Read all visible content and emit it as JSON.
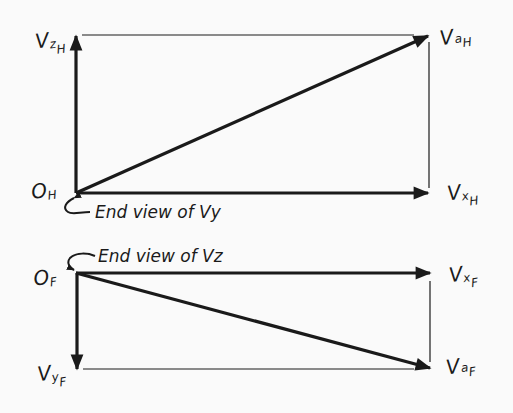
{
  "diagram": {
    "type": "vector-projection",
    "colors": {
      "ink": "#1a1a1a",
      "background": "#fafafa"
    },
    "top_view": {
      "origin": {
        "main": "O",
        "sub": "H"
      },
      "vectors": [
        {
          "id": "Vz_H",
          "main": "V",
          "sub1": "z",
          "sub2": "H",
          "direction": "up"
        },
        {
          "id": "Vx_H",
          "main": "V",
          "sub1": "x",
          "sub2": "H",
          "direction": "right"
        },
        {
          "id": "Va_H",
          "main": "V",
          "sub1": "a",
          "sub2": "H",
          "direction": "diagonal-up-right"
        }
      ],
      "note": "End view of Vy"
    },
    "front_view": {
      "origin": {
        "main": "O",
        "sub": "F"
      },
      "vectors": [
        {
          "id": "Vx_F",
          "main": "V",
          "sub1": "x",
          "sub2": "F",
          "direction": "right"
        },
        {
          "id": "Vy_F",
          "main": "V",
          "sub1": "y",
          "sub2": "F",
          "direction": "down"
        },
        {
          "id": "Va_F",
          "main": "V",
          "sub1": "a",
          "sub2": "F",
          "direction": "diagonal-down-right"
        }
      ],
      "note": "End view of Vz"
    }
  }
}
